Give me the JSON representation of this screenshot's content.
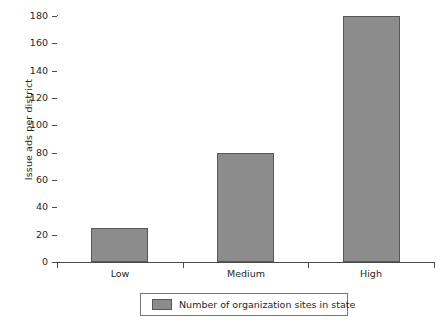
{
  "chart_data": {
    "type": "bar",
    "title": "",
    "subtitle": "",
    "categories": [
      "Low",
      "Medium",
      "High"
    ],
    "values": [
      25,
      80,
      180
    ],
    "series": [
      {
        "name": "Number of organization sites in state",
        "values": [
          25,
          80,
          180
        ]
      }
    ],
    "xlabel": "",
    "ylabel": "Issue ads per district",
    "ylim": [
      0,
      180
    ],
    "ytick_step": 20,
    "yticks": [
      0,
      20,
      40,
      60,
      80,
      100,
      120,
      140,
      160,
      180
    ],
    "ytick_labels": [
      "0",
      "20",
      "40",
      "60",
      "80",
      "100",
      "120",
      "140",
      "160",
      "180"
    ],
    "grid": false,
    "legend": {
      "position": "bottom",
      "entries": [
        {
          "label": "Number of organization sites in state",
          "color": "#8c8c8c"
        }
      ]
    },
    "colors": {
      "bar_fill": "#8c8c8c",
      "bar_border": "#585858",
      "axis": "#4a4a4a",
      "text": "#1f1f1f",
      "background": "#ffffff",
      "legend_border": "#767676"
    }
  }
}
